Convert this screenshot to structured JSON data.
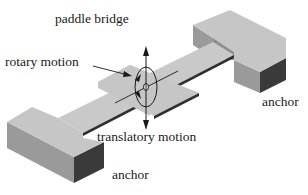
{
  "diagram": {
    "labels": {
      "paddle_bridge": "paddle bridge",
      "rotary_motion": "rotary motion",
      "translatory_motion": "translatory motion",
      "anchor_right": "anchor",
      "anchor_left": "anchor"
    },
    "colors": {
      "top_face": "#c4c4c4",
      "side_face_light": "#9a9a9a",
      "side_face_dark": "#3a3a3a",
      "edge": "#2a2a2a",
      "text": "#1a1a1a"
    }
  }
}
